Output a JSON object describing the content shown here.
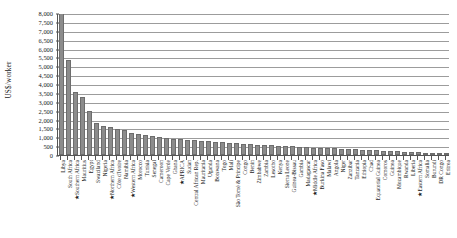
{
  "chart_data": {
    "type": "bar",
    "title": "",
    "subtitle": "",
    "xlabel": "",
    "ylabel": "US$/worker",
    "ylim": [
      0,
      8000
    ],
    "ytick_step": 500,
    "grid": true,
    "legend": null,
    "note": "Bars sorted descending; starred (★) entries are regional aggregates. Libya's bar is clipped at the top of the 8,000 axis.",
    "yticks": [
      "8,000",
      "7,500",
      "7,000",
      "6,500",
      "6,000",
      "5,500",
      "5,000",
      "4,500",
      "4,000",
      "3,500",
      "3,000",
      "2,500",
      "2,000",
      "1,500",
      "1,000",
      "500",
      "0"
    ],
    "categories": [
      "Libya",
      "South Africa",
      "★Southern Africa",
      "Mauritius",
      "Egypt",
      "Swaziland",
      "Nigeria",
      "★Northern Africa",
      "Côte d'Ivoire",
      "Namibia",
      "★Western Africa",
      "Morocco",
      "Tunisia",
      "Senegal",
      "Cameroon",
      "Cape Verde",
      "Ghana",
      "★AFRICA",
      "Sudan",
      "Central African Rep.",
      "Mauritania",
      "Uganda",
      "Botswana",
      "Togo",
      "Mali",
      "São Tomé & Príncipe",
      "Congo",
      "Benin",
      "Zimbabwe",
      "Zambia",
      "Lesotho",
      "Kenya",
      "Sierra Leone",
      "Guinea-Bissau",
      "Gambia",
      "Madagascar",
      "★Middle Africa",
      "Burkina Faso",
      "Malawi",
      "Angola",
      "Niger",
      "Zanzibar",
      "Tanzania",
      "Ethiopia",
      "Chad",
      "Equatorial Guinea",
      "Comoros",
      "Guinea",
      "Mozambique",
      "Rwanda",
      "Liberia",
      "★Eastern Africa",
      "Somalia",
      "Burundi",
      "DR Congo",
      "Eritrea"
    ],
    "values": [
      8000,
      5350,
      3550,
      3250,
      2500,
      1800,
      1650,
      1560,
      1460,
      1400,
      1240,
      1180,
      1130,
      1060,
      1010,
      960,
      930,
      900,
      870,
      840,
      800,
      770,
      740,
      710,
      690,
      660,
      640,
      610,
      590,
      570,
      540,
      520,
      500,
      480,
      460,
      440,
      420,
      400,
      385,
      370,
      350,
      330,
      315,
      300,
      285,
      265,
      250,
      230,
      215,
      195,
      175,
      155,
      130,
      105,
      75,
      40
    ]
  },
  "colors": {
    "bar_fill": "#8c8c8c",
    "bar_stroke": "#6d6d6d",
    "gridline": "#9c9c9c",
    "axis": "#555555",
    "text": "#1a1a1a",
    "background": "#ffffff"
  }
}
